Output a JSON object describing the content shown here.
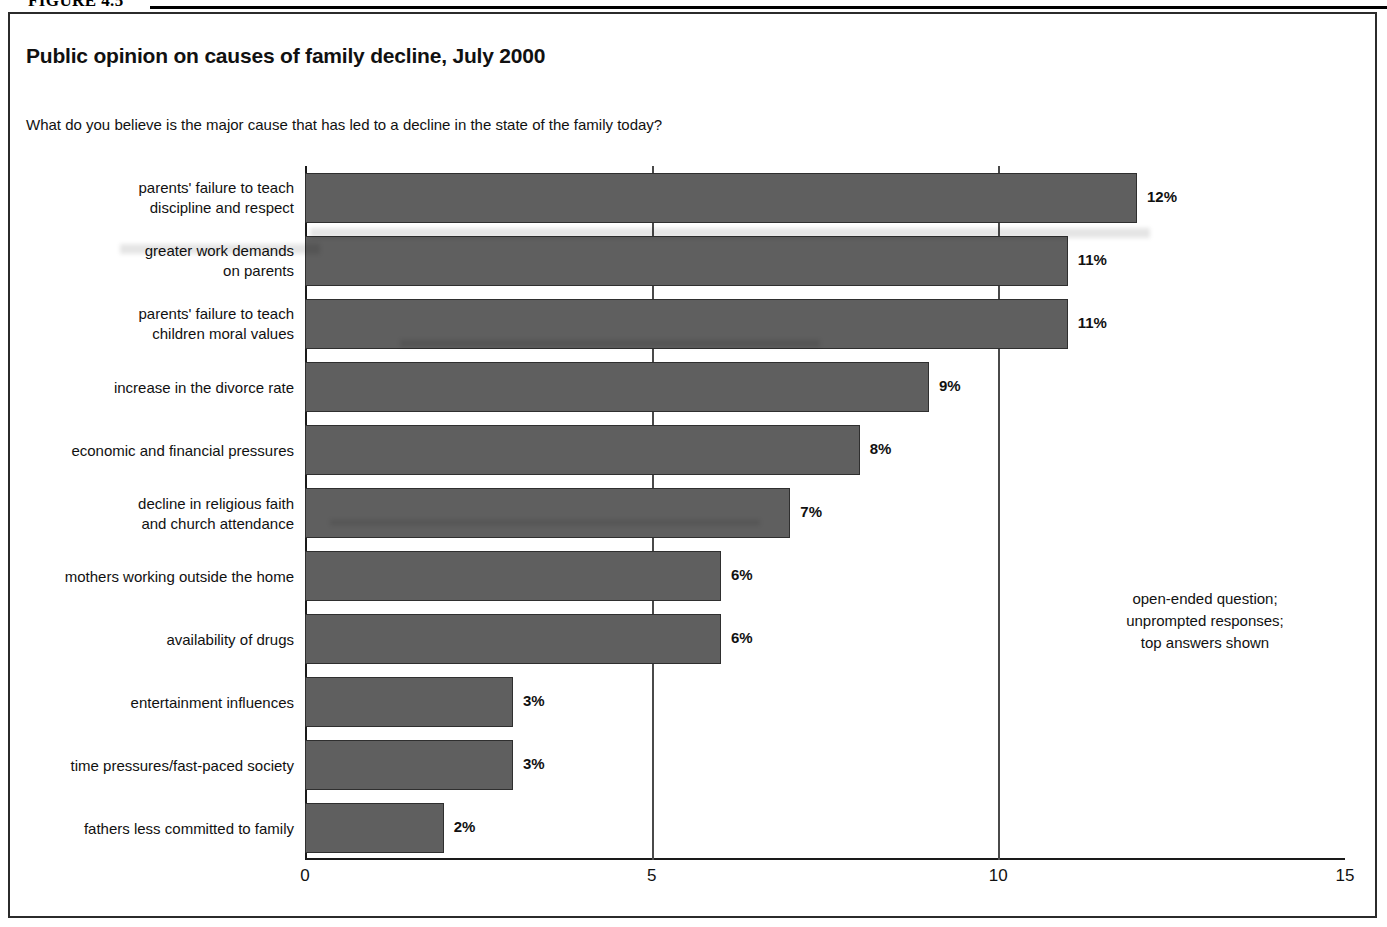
{
  "figure": {
    "label": "FIGURE 4.5"
  },
  "title": "Public opinion on causes of family decline, July 2000",
  "question": "What do you believe is the major cause that has led to a decline in the state of the family today?",
  "note": "open-ended question;\nunprompted responses;\ntop answers shown",
  "chart_data": {
    "type": "bar",
    "orientation": "horizontal",
    "title": "Public opinion on causes of family decline, July 2000",
    "xlabel": "",
    "ylabel": "",
    "xlim": [
      0,
      15
    ],
    "xticks": [
      "0",
      "5",
      "10",
      "15"
    ],
    "xtick_values": [
      0,
      5,
      10,
      15
    ],
    "grid": true,
    "legend": null,
    "categories": [
      "parents' failure to teach\ndiscipline and respect",
      "greater work demands\non parents",
      "parents' failure to teach\nchildren moral values",
      "increase in the divorce rate",
      "economic and financial pressures",
      "decline in religious faith\nand church attendance",
      "mothers working outside the home",
      "availability of drugs",
      "entertainment influences",
      "time pressures/fast-paced society",
      "fathers less committed to family"
    ],
    "values": [
      12,
      11,
      11,
      9,
      8,
      7,
      6,
      6,
      3,
      3,
      2
    ],
    "value_labels": [
      "12%",
      "11%",
      "11%",
      "9%",
      "8%",
      "7%",
      "6%",
      "6%",
      "3%",
      "3%",
      "2%"
    ],
    "bar_color": "#5f5f5f"
  }
}
